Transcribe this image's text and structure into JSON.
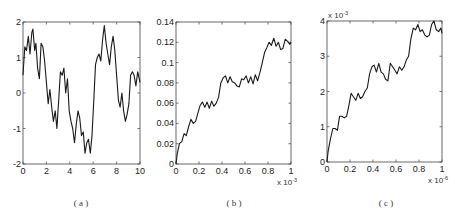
{
  "chart_data": [
    {
      "type": "line",
      "panel": "a",
      "caption": "( a )",
      "xlim": [
        0,
        10
      ],
      "ylim": [
        -2,
        2
      ],
      "xticks": [
        "0",
        "2",
        "4",
        "6",
        "8",
        "10"
      ],
      "yticks": [
        "-2",
        "-1",
        "0",
        "1",
        "2"
      ],
      "x_exponent": "",
      "y_exponent": "",
      "grid": false,
      "x": [
        0,
        0.15,
        0.3,
        0.45,
        0.6,
        0.75,
        0.85,
        1.0,
        1.1,
        1.25,
        1.4,
        1.55,
        1.7,
        1.85,
        2.0,
        2.15,
        2.3,
        2.45,
        2.6,
        2.75,
        2.9,
        3.05,
        3.2,
        3.35,
        3.5,
        3.65,
        3.8,
        3.95,
        4.1,
        4.25,
        4.4,
        4.55,
        4.7,
        4.85,
        5.0,
        5.15,
        5.3,
        5.45,
        5.6,
        5.75,
        5.9,
        6.05,
        6.2,
        6.35,
        6.5,
        6.65,
        6.8,
        6.95,
        7.1,
        7.25,
        7.4,
        7.55,
        7.7,
        7.85,
        8.0,
        8.15,
        8.3,
        8.45,
        8.6,
        8.75,
        8.9,
        9.05,
        9.2,
        9.35,
        9.5,
        9.65,
        9.8,
        10.0
      ],
      "y": [
        0.5,
        1.3,
        1.2,
        1.6,
        1.1,
        1.7,
        1.8,
        1.2,
        1.4,
        0.7,
        0.4,
        1.4,
        1.3,
        0.9,
        0.3,
        -0.3,
        0.1,
        -0.4,
        -0.8,
        -0.5,
        -1.0,
        -0.2,
        0.6,
        0.5,
        0.7,
        0.0,
        0.4,
        -0.5,
        -0.8,
        -1.0,
        -1.4,
        -0.9,
        -0.5,
        -0.7,
        -1.2,
        -1.1,
        -1.7,
        -1.4,
        -1.3,
        -1.7,
        -1.2,
        -0.2,
        0.8,
        1.0,
        1.1,
        0.9,
        1.5,
        1.9,
        1.4,
        1.1,
        0.8,
        1.3,
        1.6,
        1.2,
        0.5,
        -0.2,
        -0.4,
        0.0,
        -0.5,
        -0.8,
        -0.6,
        -0.3,
        0.5,
        0.6,
        0.5,
        0.2,
        0.6,
        0.3
      ]
    },
    {
      "type": "line",
      "panel": "b",
      "caption": "( b )",
      "xlim": [
        0,
        1
      ],
      "ylim": [
        0,
        0.14
      ],
      "xticks": [
        "0",
        "0.2",
        "0.4",
        "0.6",
        "0.8",
        "1"
      ],
      "yticks": [
        "0",
        "0.02",
        "0.04",
        "0.06",
        "0.08",
        "0.1",
        "0.12",
        "0.14"
      ],
      "x_exponent": "x 10",
      "x_exponent_power": "-3",
      "y_exponent": "",
      "grid": false,
      "x": [
        0,
        0.01,
        0.03,
        0.05,
        0.07,
        0.09,
        0.11,
        0.13,
        0.15,
        0.17,
        0.19,
        0.21,
        0.23,
        0.25,
        0.27,
        0.29,
        0.31,
        0.33,
        0.35,
        0.37,
        0.39,
        0.41,
        0.43,
        0.45,
        0.47,
        0.49,
        0.51,
        0.53,
        0.55,
        0.57,
        0.59,
        0.61,
        0.63,
        0.65,
        0.67,
        0.69,
        0.71,
        0.73,
        0.75,
        0.77,
        0.79,
        0.81,
        0.83,
        0.85,
        0.87,
        0.89,
        0.91,
        0.93,
        0.95,
        0.97,
        0.99,
        1.0
      ],
      "y": [
        0.0,
        0.01,
        0.02,
        0.022,
        0.03,
        0.028,
        0.037,
        0.044,
        0.04,
        0.042,
        0.05,
        0.058,
        0.061,
        0.056,
        0.061,
        0.055,
        0.062,
        0.057,
        0.06,
        0.066,
        0.08,
        0.085,
        0.087,
        0.08,
        0.086,
        0.081,
        0.08,
        0.077,
        0.076,
        0.084,
        0.083,
        0.087,
        0.08,
        0.086,
        0.079,
        0.088,
        0.082,
        0.09,
        0.1,
        0.11,
        0.115,
        0.12,
        0.117,
        0.124,
        0.116,
        0.12,
        0.113,
        0.114,
        0.123,
        0.121,
        0.118,
        0.12
      ]
    },
    {
      "type": "line",
      "panel": "c",
      "caption": "( c )",
      "xlim": [
        0,
        1
      ],
      "ylim": [
        0,
        4
      ],
      "xticks": [
        "0",
        "0.2",
        "0.4",
        "0.6",
        "0.8",
        "1"
      ],
      "yticks": [
        "0",
        "1",
        "2",
        "3",
        "4"
      ],
      "x_exponent": "x 10",
      "x_exponent_power": "-6",
      "y_exponent": "x 10",
      "y_exponent_power": "-3",
      "grid": false,
      "x": [
        0,
        0.01,
        0.03,
        0.05,
        0.07,
        0.09,
        0.11,
        0.13,
        0.15,
        0.17,
        0.19,
        0.21,
        0.23,
        0.25,
        0.27,
        0.29,
        0.31,
        0.33,
        0.35,
        0.37,
        0.39,
        0.41,
        0.43,
        0.45,
        0.47,
        0.49,
        0.51,
        0.53,
        0.55,
        0.57,
        0.59,
        0.61,
        0.63,
        0.65,
        0.67,
        0.69,
        0.71,
        0.73,
        0.75,
        0.77,
        0.79,
        0.81,
        0.83,
        0.85,
        0.87,
        0.89,
        0.91,
        0.93,
        0.95,
        0.97,
        0.99,
        1.0
      ],
      "y": [
        0.0,
        0.3,
        0.65,
        0.95,
        0.95,
        0.9,
        1.3,
        1.3,
        1.25,
        1.3,
        1.6,
        1.95,
        1.85,
        1.75,
        1.95,
        1.8,
        1.85,
        2.0,
        2.1,
        2.5,
        2.7,
        2.75,
        2.55,
        2.8,
        2.55,
        2.5,
        2.35,
        2.3,
        2.8,
        2.7,
        2.6,
        2.5,
        2.7,
        2.6,
        2.7,
        2.9,
        3.0,
        3.5,
        3.8,
        3.75,
        3.9,
        3.7,
        3.75,
        3.6,
        3.55,
        3.6,
        3.9,
        4.0,
        3.75,
        3.7,
        3.8,
        3.65
      ]
    }
  ]
}
